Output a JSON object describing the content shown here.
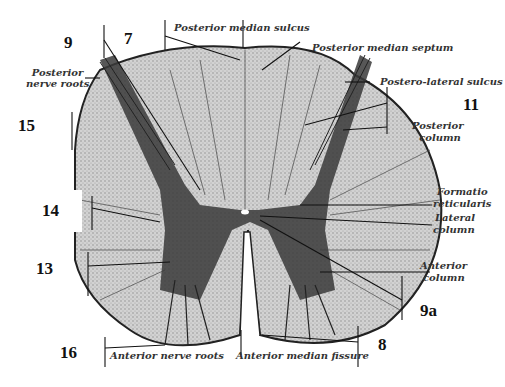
{
  "figure": {
    "colors": {
      "white_matter": "#c9c9c9",
      "gray_matter": "#3a3a3a",
      "outline": "#222222",
      "background": "#ffffff"
    }
  },
  "labels": {
    "posterior_median_sulcus": "Posterior median sulcus",
    "posterior_median_septum": "Posterior median septum",
    "posterior_nerve_roots_1": "Posterior",
    "posterior_nerve_roots_2": "nerve roots",
    "postero_lateral_sulcus": "Postero-lateral sulcus",
    "posterior_column_1": "Posterior",
    "posterior_column_2": "column",
    "formatio_reticularis_1": "Formatio",
    "formatio_reticularis_2": "reticularis",
    "lateral_column_1": "Lateral",
    "lateral_column_2": "column",
    "anterior_column_1": "Anterior",
    "anterior_column_2": "column",
    "anterior_nerve_roots": "Anterior nerve roots",
    "anterior_median_fissure": "Anterior median fissure"
  },
  "numbers": {
    "n9": "9",
    "n7": "7",
    "n15": "15",
    "n11": "11",
    "n14": "14",
    "n13": "13",
    "n9a": "9a",
    "n16": "16",
    "n8": "8"
  }
}
